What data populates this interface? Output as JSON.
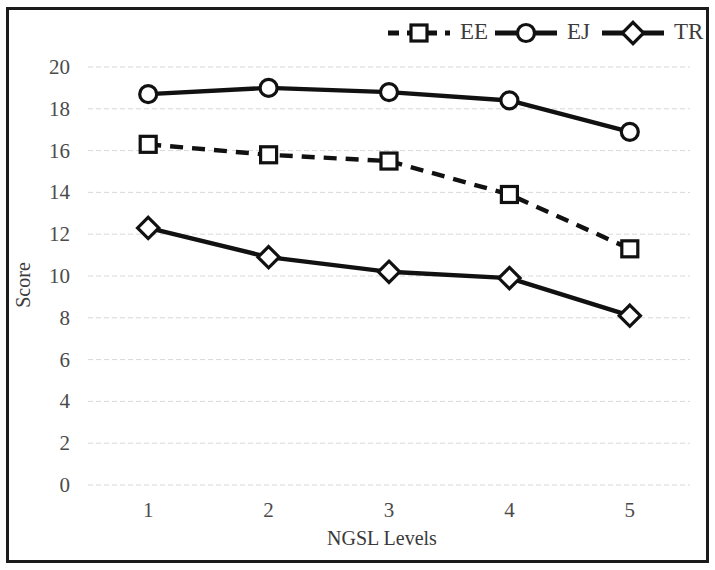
{
  "chart_data": {
    "type": "line",
    "title": "",
    "xlabel": "NGSL Levels",
    "ylabel": "Score",
    "categories": [
      "1",
      "2",
      "3",
      "4",
      "5"
    ],
    "x": [
      1,
      2,
      3,
      4,
      5
    ],
    "xlim": [
      0.5,
      5.5
    ],
    "ylim": [
      0,
      20
    ],
    "ytick_labels": [
      "0",
      "2",
      "4",
      "6",
      "8",
      "10",
      "12",
      "14",
      "16",
      "18",
      "20"
    ],
    "yticks": [
      0,
      2,
      4,
      6,
      8,
      10,
      12,
      14,
      16,
      18,
      20
    ],
    "grid": "horizontal",
    "legend_position": "top-right",
    "series": [
      {
        "name": "EE",
        "marker": "square",
        "line_style": "dashed",
        "color": "#111111",
        "values": [
          16.3,
          15.8,
          15.5,
          13.9,
          11.3
        ]
      },
      {
        "name": "EJ",
        "marker": "circle",
        "line_style": "solid",
        "color": "#111111",
        "values": [
          18.7,
          19.0,
          18.8,
          18.4,
          16.9
        ]
      },
      {
        "name": "TR",
        "marker": "diamond",
        "line_style": "solid",
        "color": "#111111",
        "values": [
          12.3,
          10.9,
          10.2,
          9.9,
          8.1
        ]
      }
    ]
  },
  "legend": {
    "items": [
      {
        "label": "EE"
      },
      {
        "label": "EJ"
      },
      {
        "label": "TR"
      }
    ]
  },
  "axes": {
    "y_title": "Score",
    "x_title": "NGSL Levels"
  },
  "colors": {
    "frame": "#1b1b1b",
    "gridline": "#d8d8d8",
    "series": "#111111",
    "text": "#3c3c3c",
    "background": "#ffffff"
  }
}
